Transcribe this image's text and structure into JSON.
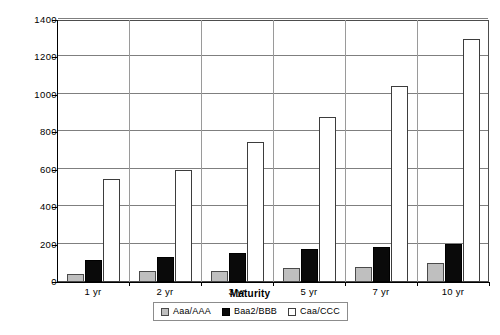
{
  "chart_data": {
    "type": "bar",
    "title": "",
    "subtitle": "",
    "xlabel": "Maturity",
    "ylabel": "",
    "categories": [
      "1 yr",
      "2 yr",
      "3 yr",
      "5 yr",
      "7 yr",
      "10 yr"
    ],
    "series": [
      {
        "name": "Aaa/AAA",
        "color": "#bfbfbf",
        "values": [
          45,
          57,
          60,
          75,
          82,
          100
        ]
      },
      {
        "name": "Baa2/BBB",
        "color": "#0a0a0a",
        "values": [
          120,
          135,
          155,
          178,
          188,
          205
        ]
      },
      {
        "name": "Caa/CCC",
        "color": "#ffffff",
        "values": [
          548,
          598,
          750,
          880,
          1050,
          1300
        ]
      }
    ],
    "ylim": [
      0,
      1400
    ],
    "y_ticks": [
      0,
      200,
      400,
      600,
      800,
      1000,
      1200,
      1400
    ],
    "y_tick_labels": [
      "0",
      "200",
      "400",
      "600",
      "800",
      "1000",
      "1200",
      "1400"
    ],
    "grid": true,
    "legend_position": "bottom",
    "legend_entries": [
      "Aaa/AAA",
      "Baa2/BBB",
      "Caa/CCC"
    ]
  }
}
